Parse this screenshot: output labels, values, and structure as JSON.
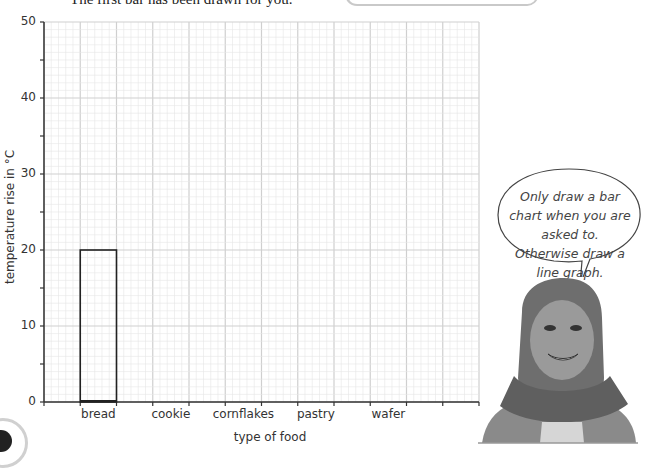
{
  "instruction": "The first bar has been drawn for you.",
  "chart_data": {
    "type": "bar",
    "title": "",
    "xlabel": "type of food",
    "ylabel": "temperature rise in °C",
    "categories": [
      "bread",
      "cookie",
      "cornflakes",
      "pastry",
      "wafer"
    ],
    "values": [
      20,
      null,
      null,
      null,
      null
    ],
    "ylim": [
      0,
      50
    ],
    "yticks": [
      "0",
      "10",
      "20",
      "30",
      "40",
      "50"
    ],
    "grid": true,
    "legend": "none"
  },
  "speech_bubble": {
    "text": "Only draw a bar chart when you are asked to. Otherwise draw a line graph."
  },
  "colors": {
    "axis": "#333333",
    "grid_major": "#cfcfcf",
    "grid_minor": "#e6e6e6",
    "bar_outline": "#222222"
  }
}
